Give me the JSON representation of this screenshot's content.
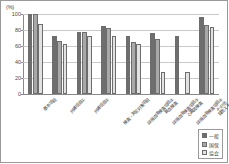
{
  "axis": {
    "unit_label": "(%)",
    "y_ticks": [
      0,
      20,
      40,
      60,
      80,
      100
    ],
    "y_min": 0,
    "y_max": 100
  },
  "legend": {
    "items": [
      {
        "label": "一般",
        "color": "#6e6e6e"
      },
      {
        "label": "国保",
        "color": "#a8a8a8"
      },
      {
        "label": "協会",
        "color": "#e2e2e2"
      }
    ]
  },
  "chart_data": {
    "type": "bar",
    "title": "",
    "xlabel": "",
    "ylabel": "(%)",
    "ylim": [
      0,
      100
    ],
    "grid": true,
    "legend_position": "bottom-right",
    "categories": [
      "基本項目",
      "共通項目①",
      "共通項目②",
      "検査・測定対象項目",
      "詳細血液検査項目②\n貧血検査",
      "詳細血液検査項目③\n心電図検査",
      "詳細血液検査項目④\nその他",
      "質問スキャン"
    ],
    "series": [
      {
        "name": "一般",
        "color": "#6e6e6e",
        "values": [
          100,
          72,
          77,
          85,
          73,
          76,
          72,
          96
        ]
      },
      {
        "name": "国保",
        "color": "#a8a8a8",
        "values": [
          100,
          66,
          77,
          82,
          65,
          69,
          null,
          86
        ]
      },
      {
        "name": "協会",
        "color": "#e2e2e2",
        "values": [
          88,
          62,
          73,
          73,
          62,
          28,
          28,
          84
        ]
      }
    ]
  }
}
